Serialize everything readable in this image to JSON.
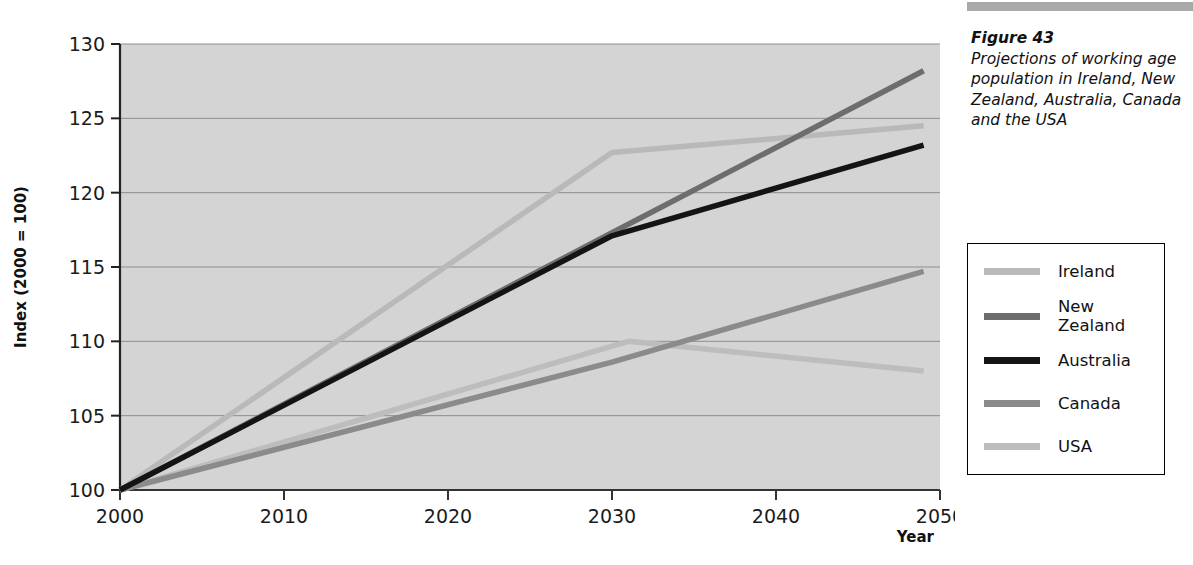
{
  "figure": {
    "caption_title": "Figure 43",
    "caption_text": "Projections of working age population in Ireland, New Zealand, Australia, Canada and the USA"
  },
  "legend": {
    "items": [
      {
        "label": "Ireland",
        "color": "#b9b9b9"
      },
      {
        "label": "New\nZealand",
        "color": "#6d6d6d"
      },
      {
        "label": "Australia",
        "color": "#141414"
      },
      {
        "label": "Canada",
        "color": "#8b8b8b"
      },
      {
        "label": "USA",
        "color": "#bdbdbd"
      }
    ]
  },
  "chart_data": {
    "type": "line",
    "title": "Projections of working age population in Ireland, New Zealand, Australia, Canada and the USA",
    "xlabel": "Year",
    "ylabel": "Index (2000 = 100)",
    "xlim": [
      2000,
      2050
    ],
    "ylim": [
      100,
      130
    ],
    "xticks": [
      2000,
      2010,
      2020,
      2030,
      2040,
      2050
    ],
    "yticks": [
      100,
      105,
      110,
      115,
      120,
      125,
      130
    ],
    "xtick_labels": [
      "2000",
      "2010",
      "2020",
      "2030",
      "2040",
      "2050"
    ],
    "ytick_labels": [
      "100",
      "105",
      "110",
      "115",
      "120",
      "125",
      "130"
    ],
    "grid": "horizontal",
    "legend_position": "outside-right",
    "plot_background": "#d4d4d4",
    "series": [
      {
        "name": "Ireland",
        "color": "#b9b9b9",
        "x": [
          2000,
          2030,
          2049
        ],
        "values": [
          100.0,
          122.7,
          124.5
        ]
      },
      {
        "name": "New Zealand",
        "color": "#6d6d6d",
        "x": [
          2000,
          2030,
          2049
        ],
        "values": [
          100.0,
          117.3,
          128.2
        ]
      },
      {
        "name": "Australia",
        "color": "#141414",
        "x": [
          2000,
          2030,
          2049
        ],
        "values": [
          100.0,
          117.1,
          123.2
        ]
      },
      {
        "name": "Canada",
        "color": "#8b8b8b",
        "x": [
          2000,
          2030,
          2049
        ],
        "values": [
          100.0,
          108.6,
          114.7
        ]
      },
      {
        "name": "USA",
        "color": "#bdbdbd",
        "x": [
          2000,
          2031,
          2049
        ],
        "values": [
          100.0,
          110.0,
          108.0
        ]
      }
    ]
  }
}
